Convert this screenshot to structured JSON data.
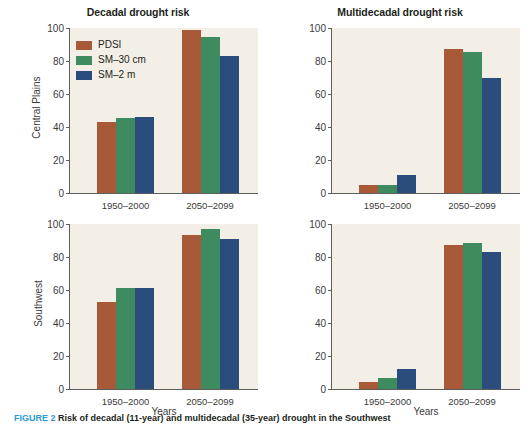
{
  "figure": {
    "caption_number": "FIGURE 2",
    "caption_text": " Risk of decadal (11-year) and multidecadal (35-year) drought in the Southwest"
  },
  "legend": {
    "position": "top-left-panel",
    "items": [
      {
        "label": "PDSI",
        "color": "#a85a38",
        "key": "pdsi"
      },
      {
        "label": "SM–30 cm",
        "color": "#3d8b5f",
        "key": "sm30"
      },
      {
        "label": "SM–2 m",
        "color": "#2b4d7e",
        "key": "sm2"
      }
    ]
  },
  "axes": {
    "y_ticks": [
      0,
      20,
      40,
      60,
      80,
      100
    ],
    "y_tick_labels": [
      "0",
      "20",
      "40",
      "60",
      "80",
      "100"
    ],
    "ylim": [
      0,
      100
    ],
    "x_categories": [
      "1950–2000",
      "2050–2099"
    ],
    "xlabel": "Years",
    "row_labels": [
      "Central Plains",
      "Southwest"
    ],
    "column_titles": [
      "Decadal drought risk",
      "Multidecadal drought risk"
    ]
  },
  "chart_data": [
    {
      "type": "bar",
      "title": "Decadal drought risk",
      "row": "Central Plains",
      "panel": "top-left",
      "categories": [
        "1950–2000",
        "2050–2099"
      ],
      "series": [
        {
          "name": "PDSI",
          "values": [
            43,
            98.5
          ],
          "color": "#a85a38"
        },
        {
          "name": "SM–30 cm",
          "values": [
            45.5,
            94.5
          ],
          "color": "#3d8b5f"
        },
        {
          "name": "SM–2 m",
          "values": [
            46,
            83
          ],
          "color": "#2b4d7e"
        }
      ],
      "xlabel": "",
      "ylabel": "Central Plains",
      "ylim": [
        0,
        100
      ],
      "grid": false,
      "legend_position": "upper left"
    },
    {
      "type": "bar",
      "title": "Multidecadal drought risk",
      "row": "Central Plains",
      "panel": "top-right",
      "categories": [
        "1950–2000",
        "2050–2099"
      ],
      "series": [
        {
          "name": "PDSI",
          "values": [
            5,
            87.5
          ],
          "color": "#a85a38"
        },
        {
          "name": "SM–30 cm",
          "values": [
            5,
            85.5
          ],
          "color": "#3d8b5f"
        },
        {
          "name": "SM–2 m",
          "values": [
            11,
            69.5
          ],
          "color": "#2b4d7e"
        }
      ],
      "xlabel": "",
      "ylabel": "",
      "ylim": [
        0,
        100
      ],
      "grid": false,
      "legend_position": "none"
    },
    {
      "type": "bar",
      "title": "",
      "row": "Southwest",
      "panel": "bottom-left",
      "categories": [
        "1950–2000",
        "2050–2099"
      ],
      "series": [
        {
          "name": "PDSI",
          "values": [
            52.5,
            93.5
          ],
          "color": "#a85a38"
        },
        {
          "name": "SM–30 cm",
          "values": [
            61.5,
            97
          ],
          "color": "#3d8b5f"
        },
        {
          "name": "SM–2 m",
          "values": [
            61.5,
            91
          ],
          "color": "#2b4d7e"
        }
      ],
      "xlabel": "Years",
      "ylabel": "Southwest",
      "ylim": [
        0,
        100
      ],
      "grid": false,
      "legend_position": "none"
    },
    {
      "type": "bar",
      "title": "",
      "row": "Southwest",
      "panel": "bottom-right",
      "categories": [
        "1950–2000",
        "2050–2099"
      ],
      "series": [
        {
          "name": "PDSI",
          "values": [
            4,
            87
          ],
          "color": "#a85a38"
        },
        {
          "name": "SM–30 cm",
          "values": [
            6.5,
            88.5
          ],
          "color": "#3d8b5f"
        },
        {
          "name": "SM–2 m",
          "values": [
            12,
            83
          ],
          "color": "#2b4d7e"
        }
      ],
      "xlabel": "Years",
      "ylabel": "",
      "ylim": [
        0,
        100
      ],
      "grid": false,
      "legend_position": "none"
    }
  ]
}
